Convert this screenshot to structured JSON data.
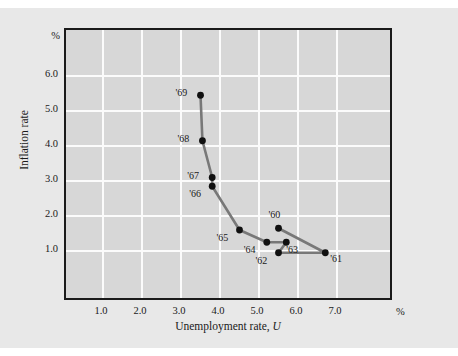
{
  "chart_data": {
    "type": "line",
    "title": "",
    "xlabel": "Unemployment rate, U",
    "ylabel": "Inflation rate",
    "x_unit": "%",
    "y_unit": "%",
    "xlim": [
      0.0,
      8.0
    ],
    "ylim": [
      0.0,
      7.0
    ],
    "grid": true,
    "legend": "none",
    "xticks": [
      "1.0",
      "2.0",
      "3.0",
      "4.0",
      "5.0",
      "6.0",
      "7.0"
    ],
    "xtick_values": [
      1.0,
      2.0,
      3.0,
      4.0,
      5.0,
      6.0,
      7.0
    ],
    "yticks": [
      "1.0",
      "2.0",
      "3.0",
      "4.0",
      "5.0",
      "6.0"
    ],
    "ytick_values": [
      1.0,
      2.0,
      3.0,
      4.0,
      5.0,
      6.0
    ],
    "series": [
      {
        "name": "Phillips curve 1960-1969",
        "line_color": "#787878",
        "marker_color": "#101010",
        "points": [
          {
            "label": "'60",
            "x": 5.5,
            "y": 1.65,
            "label_pos": "above-left"
          },
          {
            "label": "'61",
            "x": 6.7,
            "y": 0.95,
            "label_pos": "right"
          },
          {
            "label": "'62",
            "x": 5.5,
            "y": 0.95,
            "label_pos": "below-left"
          },
          {
            "label": "'63",
            "x": 5.7,
            "y": 1.25,
            "label_pos": "below-right"
          },
          {
            "label": "'64",
            "x": 5.2,
            "y": 1.25,
            "label_pos": "below-left"
          },
          {
            "label": "'65",
            "x": 4.5,
            "y": 1.6,
            "label_pos": "below-left"
          },
          {
            "label": "'66",
            "x": 3.8,
            "y": 2.85,
            "label_pos": "below-left"
          },
          {
            "label": "'67",
            "x": 3.8,
            "y": 3.1,
            "label_pos": "left"
          },
          {
            "label": "'68",
            "x": 3.55,
            "y": 4.15,
            "label_pos": "left"
          },
          {
            "label": "'69",
            "x": 3.5,
            "y": 5.45,
            "label_pos": "left"
          }
        ]
      }
    ]
  }
}
